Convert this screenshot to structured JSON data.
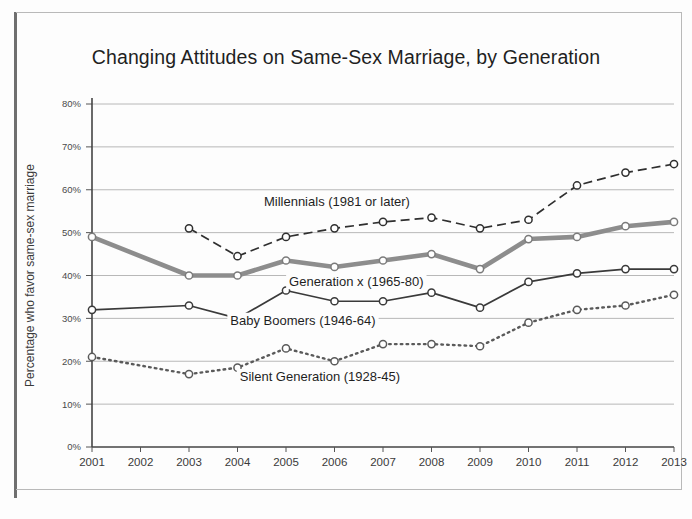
{
  "chart_data": {
    "type": "line",
    "title": "Changing Attitudes on Same-Sex Marriage, by Generation",
    "xlabel": "",
    "ylabel": "Percentage who favor same-sex marriage",
    "x": [
      2001,
      2002,
      2003,
      2004,
      2005,
      2006,
      2007,
      2008,
      2009,
      2010,
      2011,
      2012,
      2013
    ],
    "categories": [
      "2001",
      "2002",
      "2003",
      "2004",
      "2005",
      "2006",
      "2007",
      "2008",
      "2009",
      "2010",
      "2011",
      "2012",
      "2013"
    ],
    "ylim": [
      0,
      80
    ],
    "yticks": [
      0,
      10,
      20,
      30,
      40,
      50,
      60,
      70,
      80
    ],
    "ytick_labels": [
      "0%",
      "10%",
      "20%",
      "30%",
      "40%",
      "50%",
      "60%",
      "70%",
      "80%"
    ],
    "grid": true,
    "legend": "inline-annotations",
    "series": [
      {
        "name": "Millennials  (1981 or later)",
        "style": "dashed",
        "color": "#2f2f2f",
        "marker": "circle",
        "x": [
          2003,
          2004,
          2005,
          2006,
          2007,
          2008,
          2009,
          2010,
          2011,
          2012,
          2013
        ],
        "values": [
          51,
          44.5,
          49,
          51,
          52.5,
          53.5,
          51,
          53,
          61,
          64,
          66
        ]
      },
      {
        "name": "Generation x (1965-80)",
        "style": "solid-thick",
        "color": "#8d8d8d",
        "marker": "circle",
        "x": [
          2001,
          2003,
          2004,
          2005,
          2006,
          2007,
          2008,
          2009,
          2010,
          2011,
          2012,
          2013
        ],
        "values": [
          49,
          40,
          40,
          43.5,
          42,
          43.5,
          45,
          41.5,
          48.5,
          49,
          51.5,
          52.5
        ]
      },
      {
        "name": "Baby Boomers (1946-64)",
        "style": "solid",
        "color": "#3a3a3a",
        "marker": "circle",
        "x": [
          2001,
          2003,
          2004,
          2005,
          2006,
          2007,
          2008,
          2009,
          2010,
          2011,
          2012,
          2013
        ],
        "values": [
          32,
          33,
          30,
          36.5,
          34,
          34,
          36,
          32.5,
          38.5,
          40.5,
          41.5,
          41.5
        ]
      },
      {
        "name": "Silent Generation (1928-45)",
        "style": "dotted",
        "color": "#5a5a5a",
        "marker": "circle",
        "x": [
          2001,
          2003,
          2004,
          2005,
          2006,
          2007,
          2008,
          2009,
          2010,
          2011,
          2012,
          2013
        ],
        "values": [
          21,
          17,
          18.5,
          23,
          20,
          24,
          24,
          23.5,
          29,
          32,
          33,
          35.5
        ]
      }
    ],
    "annotations": [
      {
        "text": "Millennials  (1981 or later)",
        "x": 2006.05,
        "y": 56.2,
        "anchor": "middle"
      },
      {
        "text": "Generation x (1965-80)",
        "x": 2006.45,
        "y": 37.6,
        "anchor": "middle"
      },
      {
        "text": "Baby Boomers (1946-64)",
        "x": 2005.35,
        "y": 28.4,
        "anchor": "middle"
      },
      {
        "text": "Silent Generation (1928-45)",
        "x": 2005.7,
        "y": 15.3,
        "anchor": "middle"
      }
    ]
  }
}
